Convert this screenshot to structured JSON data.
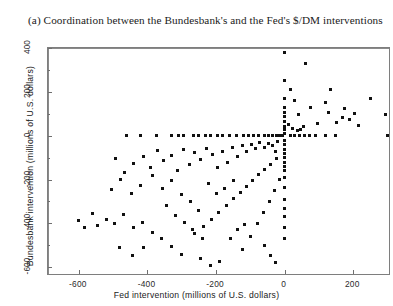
{
  "figure": {
    "caption": "(a) Coordination between the Bundesbank's and the Fed's $/DM interventions"
  },
  "chart_data": {
    "type": "scatter",
    "title": "(a) Coordination between the Bundesbank's and the Fed's $/DM interventions",
    "xlabel": "Fed intervention (millions of U.S. dollars)",
    "ylabel": "Bundesbank intervention (millions of U.S. dollars)",
    "xlim": [
      -690,
      310
    ],
    "ylim": [
      -640,
      400
    ],
    "xticks": [
      -600,
      -400,
      -200,
      0,
      200,
      400
    ],
    "yticks": [
      -600,
      -400,
      -200,
      0,
      200,
      400
    ],
    "xtick_labels": [
      "-600",
      "-400",
      "-200",
      "0",
      "200",
      "400"
    ],
    "ytick_labels": [
      "-600",
      "-400",
      "-200",
      "0",
      "200",
      "400"
    ],
    "grid": false,
    "legend": null,
    "reference_lines": [
      {
        "axis": "horizontal",
        "value": 0
      },
      {
        "axis": "vertical",
        "value": 0
      }
    ],
    "marker": {
      "shape": "square",
      "size": 3,
      "color": "#111111"
    },
    "points": [
      [
        -460,
        0
      ],
      [
        -420,
        0
      ],
      [
        -375,
        0
      ],
      [
        -330,
        0
      ],
      [
        -310,
        0
      ],
      [
        -295,
        0
      ],
      [
        -265,
        0
      ],
      [
        -250,
        0
      ],
      [
        -230,
        0
      ],
      [
        -215,
        0
      ],
      [
        -195,
        0
      ],
      [
        -180,
        0
      ],
      [
        -160,
        0
      ],
      [
        -140,
        0
      ],
      [
        -120,
        0
      ],
      [
        -105,
        0
      ],
      [
        -90,
        0
      ],
      [
        -75,
        0
      ],
      [
        -60,
        0
      ],
      [
        -48,
        0
      ],
      [
        -36,
        0
      ],
      [
        -24,
        0
      ],
      [
        -14,
        0
      ],
      [
        -7,
        0
      ],
      [
        18,
        0
      ],
      [
        30,
        0
      ],
      [
        44,
        0
      ],
      [
        58,
        0
      ],
      [
        72,
        0
      ],
      [
        90,
        0
      ],
      [
        118,
        0
      ],
      [
        148,
        0
      ],
      [
        300,
        0
      ],
      [
        0,
        380
      ],
      [
        0,
        250
      ],
      [
        0,
        170
      ],
      [
        0,
        130
      ],
      [
        0,
        108
      ],
      [
        0,
        88
      ],
      [
        0,
        66
      ],
      [
        0,
        44
      ],
      [
        0,
        26
      ],
      [
        0,
        12
      ],
      [
        0,
        -22
      ],
      [
        0,
        -40
      ],
      [
        0,
        -62
      ],
      [
        0,
        -80
      ],
      [
        0,
        -100
      ],
      [
        0,
        -120
      ],
      [
        0,
        -140
      ],
      [
        0,
        -160
      ],
      [
        0,
        -190
      ],
      [
        0,
        -235
      ],
      [
        0,
        -290
      ],
      [
        0,
        -330
      ],
      [
        0,
        -370
      ],
      [
        0,
        -420
      ],
      [
        0,
        -470
      ],
      [
        60,
        330
      ],
      [
        135,
        210
      ],
      [
        250,
        170
      ],
      [
        175,
        125
      ],
      [
        120,
        150
      ],
      [
        205,
        100
      ],
      [
        295,
        95
      ],
      [
        40,
        95
      ],
      [
        75,
        130
      ],
      [
        30,
        160
      ],
      [
        18,
        210
      ],
      [
        150,
        60
      ],
      [
        190,
        75
      ],
      [
        95,
        55
      ],
      [
        55,
        40
      ],
      [
        38,
        22
      ],
      [
        46,
        30
      ],
      [
        22,
        35
      ],
      [
        12,
        50
      ],
      [
        128,
        105
      ],
      [
        168,
        85
      ],
      [
        215,
        48
      ],
      [
        -20,
        -28
      ],
      [
        -35,
        -45
      ],
      [
        -28,
        -70
      ],
      [
        -48,
        -35
      ],
      [
        -60,
        -52
      ],
      [
        -72,
        -30
      ],
      [
        -85,
        -60
      ],
      [
        -96,
        -38
      ],
      [
        -110,
        -72
      ],
      [
        -124,
        -44
      ],
      [
        -138,
        -95
      ],
      [
        -152,
        -55
      ],
      [
        -166,
        -120
      ],
      [
        -180,
        -70
      ],
      [
        -196,
        -145
      ],
      [
        -210,
        -88
      ],
      [
        -228,
        -58
      ],
      [
        -244,
        -108
      ],
      [
        -262,
        -78
      ],
      [
        -278,
        -132
      ],
      [
        -296,
        -62
      ],
      [
        -312,
        -158
      ],
      [
        -330,
        -90
      ],
      [
        -352,
        -112
      ],
      [
        -372,
        -68
      ],
      [
        -392,
        -146
      ],
      [
        -412,
        -96
      ],
      [
        -440,
        -128
      ],
      [
        -466,
        -170
      ],
      [
        -492,
        -104
      ],
      [
        -24,
        -105
      ],
      [
        -40,
        -130
      ],
      [
        -58,
        -155
      ],
      [
        -76,
        -178
      ],
      [
        -94,
        -205
      ],
      [
        -112,
        -232
      ],
      [
        -130,
        -260
      ],
      [
        -150,
        -288
      ],
      [
        -170,
        -318
      ],
      [
        -192,
        -350
      ],
      [
        -214,
        -382
      ],
      [
        -238,
        -412
      ],
      [
        -262,
        -445
      ],
      [
        -16,
        -200
      ],
      [
        -30,
        -250
      ],
      [
        -44,
        -300
      ],
      [
        -62,
        -352
      ],
      [
        -80,
        -400
      ],
      [
        -100,
        -460
      ],
      [
        -124,
        -520
      ],
      [
        -330,
        -205
      ],
      [
        -356,
        -240
      ],
      [
        -384,
        -182
      ],
      [
        -300,
        -270
      ],
      [
        -276,
        -300
      ],
      [
        -250,
        -340
      ],
      [
        -222,
        -220
      ],
      [
        -200,
        -262
      ],
      [
        -176,
        -240
      ],
      [
        -148,
        -205
      ],
      [
        -345,
        -320
      ],
      [
        -318,
        -365
      ],
      [
        -292,
        -395
      ],
      [
        -268,
        -430
      ],
      [
        -240,
        -470
      ],
      [
        -420,
        -225
      ],
      [
        -448,
        -265
      ],
      [
        -478,
        -200
      ],
      [
        -505,
        -245
      ],
      [
        -520,
        -380
      ],
      [
        -545,
        -410
      ],
      [
        -560,
        -355
      ],
      [
        -585,
        -420
      ],
      [
        -600,
        -385
      ],
      [
        -470,
        -360
      ],
      [
        -495,
        -400
      ],
      [
        -440,
        -420
      ],
      [
        -415,
        -395
      ],
      [
        -385,
        -440
      ],
      [
        -358,
        -470
      ],
      [
        -330,
        -505
      ],
      [
        -300,
        -540
      ],
      [
        -412,
        -510
      ],
      [
        -445,
        -545
      ],
      [
        -482,
        -512
      ],
      [
        -245,
        -560
      ],
      [
        -215,
        -590
      ],
      [
        -190,
        -575
      ],
      [
        -138,
        -430
      ],
      [
        -118,
        -405
      ],
      [
        -158,
        -468
      ],
      [
        -60,
        -500
      ],
      [
        -42,
        -545
      ],
      [
        -26,
        -580
      ]
    ]
  }
}
